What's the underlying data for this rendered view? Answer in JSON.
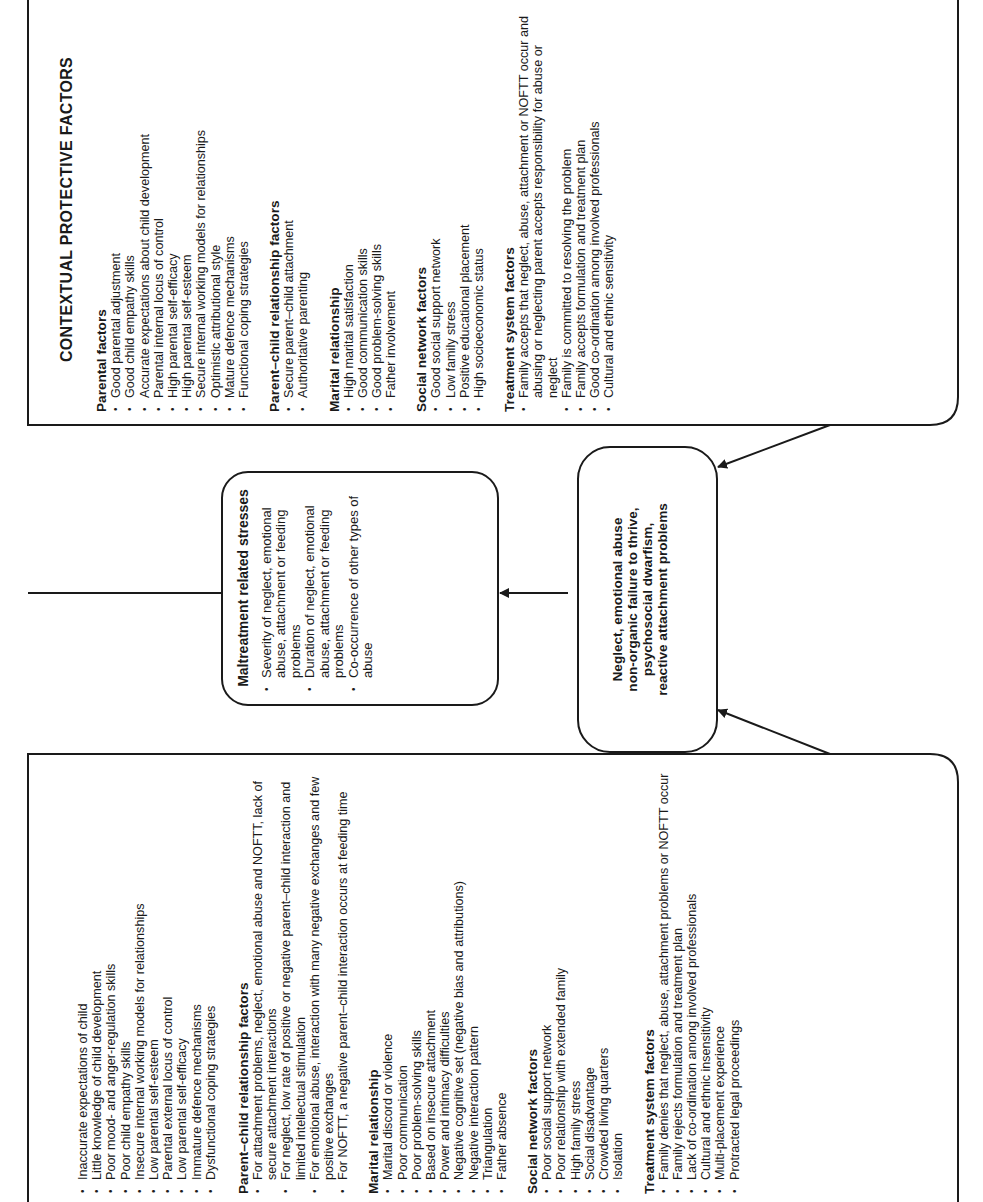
{
  "diagram": {
    "orientation": "rotated 90 degrees counter-clockwise",
    "risk_factors": {
      "sections": [
        {
          "title": "",
          "items": [
            "Inaccurate expectations of child",
            "Little knowledge of child development",
            "Poor mood- and anger-regulation skills",
            "Poor child empathy skills",
            "Insecure internal working models for relationships",
            "Low parental self-esteem",
            "Parental external locus of control",
            "Low parental self-efficacy",
            "Immature defence mechanisms",
            "Dysfunctional coping strategies"
          ]
        },
        {
          "title": "Parent–child relationship factors",
          "items": [
            "For attachment problems, neglect, emotional abuse and NOFTT, lack of secure attachment interactions",
            "For neglect, low rate of positive or negative parent–child interaction and limited intellectual stimulation",
            "For emotional abuse, interaction with many negative exchanges and few positive exchanges",
            "For NOFTT, a negative parent–child interaction occurs at feeding time"
          ]
        },
        {
          "title": "Marital relationship",
          "items": [
            "Marital discord or violence",
            "Poor communication",
            "Poor problem-solving skills",
            "Based on insecure attachment",
            "Power and intimacy difficulties",
            "Negative cognitive set (negative bias and attributions)",
            "Negative interaction pattern",
            "Triangulation",
            "Father absence"
          ]
        },
        {
          "title": "Social network factors",
          "items": [
            "Poor social support network",
            "Poor relationship with extended family",
            "High family stress",
            "Social disadvantage",
            "Crowded living quarters",
            "Isolation"
          ]
        },
        {
          "title": "Treatment system factors",
          "items": [
            "Family denies that neglect, abuse, attachment problems or NOFTT occur",
            "Family rejects formulation and treatment plan",
            "Lack of co-ordination among involved professionals",
            "Cultural and ethnic insensitivity",
            "Multi-placement experience",
            "Protracted legal proceedings"
          ]
        }
      ]
    },
    "maltreatment_stresses": {
      "title": "Maltreatment related stresses",
      "items": [
        "Severity of neglect, emotional abuse, attachment or feeding problems",
        "Duration of neglect, emotional abuse, attachment or feeding problems",
        "Co-occurrence of other types of abuse"
      ]
    },
    "outcome": {
      "lines": [
        "Neglect, emotional abuse",
        "non-organic failure to thrive,",
        "psychosocial dwarfism,",
        "reactive attachment problems"
      ]
    },
    "protective_factors": {
      "title": "CONTEXTUAL PROTECTIVE FACTORS",
      "sections": [
        {
          "title": "Parental factors",
          "items": [
            "Good parental adjustment",
            "Good child empathy skills",
            "Accurate expectations about child development",
            "Parental internal locus of control",
            "High parental self-efficacy",
            "High parental self-esteem",
            "Secure internal working models for relationships",
            "Optimistic attributional style",
            "Mature defence mechanisms",
            "Functional coping strategies"
          ]
        },
        {
          "title": "Parent–child relationship factors",
          "items": [
            "Secure parent–child attachment",
            "Authoritative parenting"
          ]
        },
        {
          "title": "Marital relationship",
          "items": [
            "High marital satisfaction",
            "Good communication skills",
            "Good problem-solving skills",
            "Father involvement"
          ]
        },
        {
          "title": "Social network factors",
          "items": [
            "Good social support network",
            "Low family stress",
            "Positive educational placement",
            "High socioeconomic status"
          ]
        },
        {
          "title": "Treatment system factors",
          "items": [
            "Family accepts that neglect, abuse, attachment or NOFTT occur and abusing or neglecting parent accepts responsibility for abuse or neglect",
            "Family is committed to resolving the problem",
            "Family accepts formulation and treatment plan",
            "Good co-ordination among involved professionals",
            "Cultural and ethnic sensitivity"
          ]
        }
      ]
    },
    "colors": {
      "line": "#1a1a1a",
      "background": "#ffffff"
    }
  }
}
